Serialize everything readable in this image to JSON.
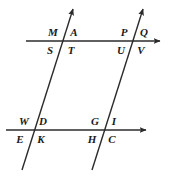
{
  "diagram": {
    "type": "geometry-parallel-lines-transversals",
    "stroke_color": "#2b2b2b",
    "label_color": "#1a1a1a",
    "background_color": "#ffffff",
    "width": 170,
    "height": 178,
    "lines": [
      {
        "id": "upper-parallel-line",
        "name": "upper-horizontal-line",
        "x1": 26,
        "y1": 41,
        "x2": 160,
        "y2": 41,
        "arrow_end": true,
        "arrow_start": false
      },
      {
        "id": "lower-parallel-line",
        "name": "lower-horizontal-line",
        "x1": 6,
        "y1": 130,
        "x2": 146,
        "y2": 130,
        "arrow_end": true,
        "arrow_start": false
      },
      {
        "id": "left-transversal",
        "name": "left-transversal-line",
        "x1": 22,
        "y1": 170,
        "x2": 73,
        "y2": 9,
        "arrow_end": true,
        "arrow_start": false
      },
      {
        "id": "right-transversal",
        "name": "right-transversal-line",
        "x1": 92,
        "y1": 170,
        "x2": 143,
        "y2": 9,
        "arrow_end": true,
        "arrow_start": false
      }
    ],
    "intersections": [
      {
        "id": "upper-left",
        "x": 63,
        "y": 41
      },
      {
        "id": "upper-right",
        "x": 133,
        "y": 41
      },
      {
        "id": "lower-left",
        "x": 33,
        "y": 130
      },
      {
        "id": "lower-right",
        "x": 104,
        "y": 130
      }
    ],
    "labels": [
      {
        "id": "label-M",
        "text": "M",
        "x": 53,
        "y": 32,
        "intersection": "upper-left",
        "quadrant": "upper-left"
      },
      {
        "id": "label-A",
        "text": "A",
        "x": 74,
        "y": 32,
        "intersection": "upper-left",
        "quadrant": "upper-right"
      },
      {
        "id": "label-S",
        "text": "S",
        "x": 50,
        "y": 50,
        "intersection": "upper-left",
        "quadrant": "lower-left"
      },
      {
        "id": "label-T",
        "text": "T",
        "x": 71,
        "y": 50,
        "intersection": "upper-left",
        "quadrant": "lower-right"
      },
      {
        "id": "label-P",
        "text": "P",
        "x": 124,
        "y": 32,
        "intersection": "upper-right",
        "quadrant": "upper-left"
      },
      {
        "id": "label-Q",
        "text": "Q",
        "x": 144,
        "y": 32,
        "intersection": "upper-right",
        "quadrant": "upper-right"
      },
      {
        "id": "label-U",
        "text": "U",
        "x": 121,
        "y": 50,
        "intersection": "upper-right",
        "quadrant": "lower-left"
      },
      {
        "id": "label-V",
        "text": "V",
        "x": 141,
        "y": 50,
        "intersection": "upper-right",
        "quadrant": "lower-right"
      },
      {
        "id": "label-W",
        "text": "W",
        "x": 24,
        "y": 121,
        "intersection": "lower-left",
        "quadrant": "upper-left"
      },
      {
        "id": "label-D",
        "text": "D",
        "x": 43,
        "y": 121,
        "intersection": "lower-left",
        "quadrant": "upper-right"
      },
      {
        "id": "label-E",
        "text": "E",
        "x": 20,
        "y": 139,
        "intersection": "lower-left",
        "quadrant": "lower-left"
      },
      {
        "id": "label-K",
        "text": "K",
        "x": 41,
        "y": 139,
        "intersection": "lower-left",
        "quadrant": "lower-right"
      },
      {
        "id": "label-G",
        "text": "G",
        "x": 95,
        "y": 121,
        "intersection": "lower-right",
        "quadrant": "upper-left"
      },
      {
        "id": "label-I",
        "text": "I",
        "x": 114,
        "y": 121,
        "intersection": "lower-right",
        "quadrant": "upper-right"
      },
      {
        "id": "label-H",
        "text": "H",
        "x": 92,
        "y": 139,
        "intersection": "lower-right",
        "quadrant": "lower-left"
      },
      {
        "id": "label-C",
        "text": "C",
        "x": 112,
        "y": 139,
        "intersection": "lower-right",
        "quadrant": "lower-right"
      }
    ]
  }
}
